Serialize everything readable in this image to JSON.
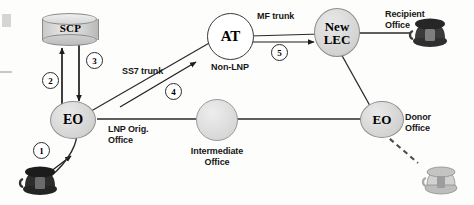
{
  "diagram": {
    "background_color": "#fdfdfc"
  },
  "nodes": [
    {
      "id": "scp",
      "type": "database",
      "label": "SCP",
      "sublabel": "",
      "fill": "#d4d4d4"
    },
    {
      "id": "eo_left",
      "type": "circle",
      "label": "EO",
      "sublabel": "LNP Orig.\nOffice",
      "fill": "#d7d7d7"
    },
    {
      "id": "at",
      "type": "circle",
      "label": "AT",
      "sublabel": "Non-LNP",
      "fill": "#ffffff"
    },
    {
      "id": "new_lec",
      "type": "circle",
      "label": "New\nLEC",
      "sublabel": "",
      "fill": "#d2d2d2"
    },
    {
      "id": "intermediate",
      "type": "circle",
      "label": "",
      "sublabel": "Intermediate\nOffice",
      "fill": "#d7d7d7"
    },
    {
      "id": "eo_right",
      "type": "circle",
      "label": "EO",
      "sublabel": "Donor\nOffice",
      "fill": "#d7d7d7"
    }
  ],
  "node_labels": {
    "scp": "SCP",
    "eo_left": "EO",
    "at": "AT",
    "new_lec_line1": "New",
    "new_lec_line2": "LEC",
    "eo_right": "EO"
  },
  "annotations": {
    "lnp_orig_office": "LNP Orig.\nOffice",
    "non_lnp": "Non-LNP",
    "intermediate_office": "Intermediate\nOffice",
    "donor_office": "Donor\nOffice",
    "recipient_office": "Recipient\nOffice",
    "ss7_trunk": "SS7 trunk",
    "mf_trunk": "MF trunk"
  },
  "steps": [
    {
      "number": "1",
      "description": "calling phone to originating EO"
    },
    {
      "number": "2",
      "description": "EO query up to SCP"
    },
    {
      "number": "3",
      "description": "SCP response down to EO"
    },
    {
      "number": "4",
      "description": "SS7 trunk from EO to AT"
    },
    {
      "number": "5",
      "description": "MF trunk from AT to New LEC"
    }
  ],
  "phones": [
    {
      "id": "calling-phone",
      "state": "active",
      "color": "#2a2a2a"
    },
    {
      "id": "recipient-phone",
      "state": "active",
      "color": "#3a3a3a"
    },
    {
      "id": "donor-phone",
      "state": "inactive",
      "color": "#c9c9c9"
    }
  ]
}
